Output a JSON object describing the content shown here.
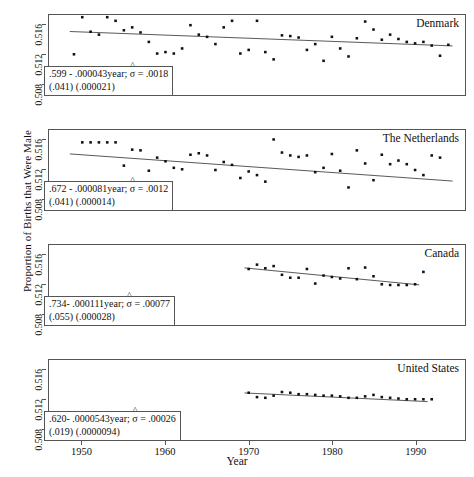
{
  "chart_data": {
    "type": "scatter",
    "title": "",
    "xlabel": "Year",
    "ylabel": "Proportion of Births that Were Male",
    "xlim": [
      1946,
      1996
    ],
    "ylim": [
      0.5065,
      0.5175
    ],
    "xticks": [
      1950,
      1960,
      1970,
      1980,
      1990
    ],
    "ytick_labels": [
      "0.508",
      "0.512",
      "0.516"
    ],
    "yticks": [
      0.508,
      0.512,
      0.516
    ],
    "grid": false,
    "legend": "none",
    "panels": [
      {
        "name": "Denmark",
        "annotation_line1": ".599 - .000043year;  σ = .0018",
        "annotation_line2": "(.041) (.000021)",
        "intercept": 0.599,
        "slope": -4.3e-05,
        "sigma": 0.0018,
        "se_intercept": 0.041,
        "se_slope": 2.1e-05,
        "fit_x": [
          1948.5,
          1994.5
        ],
        "fit_y": [
          0.51523,
          0.51325
        ],
        "x": [
          1949,
          1950,
          1951,
          1952,
          1953,
          1954,
          1955,
          1956,
          1957,
          1958,
          1959,
          1960,
          1961,
          1962,
          1963,
          1964,
          1965,
          1966,
          1967,
          1968,
          1969,
          1970,
          1971,
          1972,
          1973,
          1974,
          1975,
          1976,
          1977,
          1978,
          1979,
          1980,
          1981,
          1982,
          1983,
          1984,
          1985,
          1986,
          1987,
          1988,
          1989,
          1990,
          1991,
          1992,
          1993,
          1994
        ],
        "y": [
          0.5121,
          0.5172,
          0.5152,
          0.5148,
          0.5172,
          0.5167,
          0.5154,
          0.5158,
          0.5151,
          0.5138,
          0.5122,
          0.5124,
          0.5122,
          0.5129,
          0.5161,
          0.5148,
          0.5145,
          0.5135,
          0.5158,
          0.5167,
          0.5122,
          0.5127,
          0.5167,
          0.5124,
          0.5114,
          0.5147,
          0.5146,
          0.5144,
          0.5127,
          0.5135,
          0.5112,
          0.5145,
          0.5129,
          0.5118,
          0.5143,
          0.5166,
          0.5155,
          0.5141,
          0.5148,
          0.5142,
          0.5138,
          0.5136,
          0.5138,
          0.5133,
          0.5119,
          0.5134
        ]
      },
      {
        "name": "The Netherlands",
        "annotation_line1": ".672 - .000081year;  σ = .0012",
        "annotation_line2": "(.041) (.000014)",
        "intercept": 0.672,
        "slope": -8.1e-05,
        "sigma": 0.0012,
        "se_intercept": 0.041,
        "se_slope": 1.4e-05,
        "fit_x": [
          1948.5,
          1994.5
        ],
        "fit_y": [
          0.51421,
          0.51048
        ],
        "x": [
          1950,
          1951,
          1952,
          1953,
          1954,
          1955,
          1956,
          1957,
          1958,
          1959,
          1960,
          1961,
          1962,
          1963,
          1964,
          1965,
          1966,
          1967,
          1968,
          1969,
          1970,
          1971,
          1972,
          1973,
          1974,
          1975,
          1976,
          1977,
          1978,
          1979,
          1980,
          1981,
          1982,
          1983,
          1984,
          1985,
          1986,
          1987,
          1988,
          1989,
          1990,
          1991,
          1992,
          1993
        ],
        "y": [
          0.5158,
          0.5158,
          0.5158,
          0.5158,
          0.5158,
          0.5126,
          0.5148,
          0.5147,
          0.5119,
          0.5137,
          0.5132,
          0.5123,
          0.5121,
          0.5141,
          0.5143,
          0.514,
          0.512,
          0.5131,
          0.5127,
          0.5109,
          0.5118,
          0.5113,
          0.5104,
          0.5162,
          0.5144,
          0.514,
          0.5138,
          0.514,
          0.5117,
          0.5123,
          0.5142,
          0.5119,
          0.5096,
          0.5147,
          0.5129,
          0.5106,
          0.5141,
          0.5128,
          0.5133,
          0.5128,
          0.512,
          0.5113,
          0.514,
          0.5137
        ]
      },
      {
        "name": "Canada",
        "annotation_line1": ".734-  .000111year;  σ = .00077",
        "annotation_line2": "(.055) (.000028)",
        "intercept": 0.734,
        "slope": -0.000111,
        "sigma": 0.00077,
        "se_intercept": 0.055,
        "se_slope": 2.8e-05,
        "fit_x": [
          1969.5,
          1990.5
        ],
        "fit_y": [
          0.51435,
          0.51202
        ],
        "x": [
          1970,
          1971,
          1972,
          1973,
          1974,
          1975,
          1976,
          1977,
          1978,
          1979,
          1980,
          1981,
          1982,
          1983,
          1984,
          1985,
          1986,
          1987,
          1988,
          1989,
          1990,
          1991
        ],
        "y": [
          0.5142,
          0.5148,
          0.5143,
          0.5146,
          0.5134,
          0.513,
          0.513,
          0.5142,
          0.5122,
          0.5133,
          0.5131,
          0.5129,
          0.5143,
          0.5128,
          0.5144,
          0.5132,
          0.5121,
          0.512,
          0.512,
          0.512,
          0.5121,
          0.5138
        ]
      },
      {
        "name": "United States",
        "annotation_line1": ".620-  .0000543year;  σ = .00026",
        "annotation_line2": "(.019) (.0000094)",
        "intercept": 0.62,
        "slope": -5.43e-05,
        "sigma": 0.00026,
        "se_intercept": 0.019,
        "se_slope": 9.4e-06,
        "fit_x": [
          1969.5,
          1991.5
        ],
        "fit_y": [
          0.51297,
          0.51178
        ],
        "x": [
          1970,
          1971,
          1972,
          1973,
          1974,
          1975,
          1976,
          1977,
          1978,
          1979,
          1980,
          1981,
          1982,
          1983,
          1984,
          1985,
          1986,
          1987,
          1988,
          1989,
          1990,
          1991,
          1992
        ],
        "y": [
          0.513,
          0.5124,
          0.5123,
          0.5126,
          0.5131,
          0.513,
          0.5128,
          0.5128,
          0.5127,
          0.5126,
          0.5126,
          0.5125,
          0.5123,
          0.5123,
          0.5125,
          0.5127,
          0.5124,
          0.5123,
          0.5122,
          0.5121,
          0.5121,
          0.5121,
          0.5121
        ]
      }
    ]
  }
}
